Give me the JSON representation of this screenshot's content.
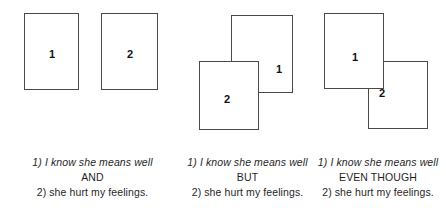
{
  "figure": {
    "groups": [
      {
        "id": "group-and",
        "relation": "AND",
        "boxes": [
          {
            "label": "1",
            "position": "left",
            "stacking": "separate"
          },
          {
            "label": "2",
            "position": "right",
            "stacking": "separate"
          }
        ],
        "caption": {
          "first_clause": "1) I know she means well",
          "connector": "AND",
          "second_clause": "2) she hurt my feelings."
        }
      },
      {
        "id": "group-but",
        "relation": "BUT",
        "boxes": [
          {
            "label": "1",
            "position": "upper-right",
            "stacking": "behind"
          },
          {
            "label": "2",
            "position": "lower-left",
            "stacking": "front"
          }
        ],
        "caption": {
          "first_clause": "1) I know she means well",
          "connector": "BUT",
          "second_clause": "2) she hurt my feelings."
        }
      },
      {
        "id": "group-even-though",
        "relation": "EVEN THOUGH",
        "boxes": [
          {
            "label": "1",
            "position": "upper-left",
            "stacking": "front"
          },
          {
            "label": "2",
            "position": "lower-right",
            "stacking": "behind"
          }
        ],
        "caption": {
          "first_clause": "1) I know she means well",
          "connector": "EVEN THOUGH",
          "second_clause": "2) she hurt my feelings."
        }
      }
    ]
  }
}
